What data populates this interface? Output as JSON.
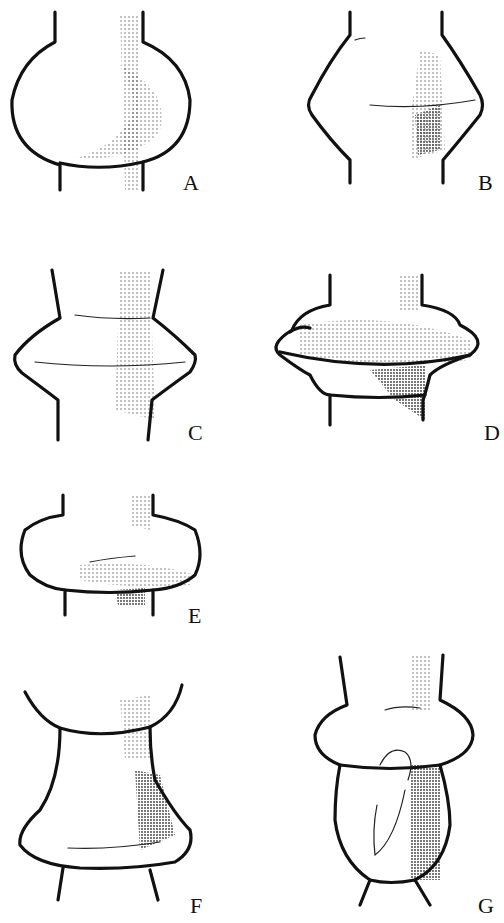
{
  "figure": {
    "panels": [
      {
        "id": "A",
        "label": "A",
        "shape": "spherical bulb between straight stems"
      },
      {
        "id": "B",
        "label": "B",
        "shape": "pointed double-cone swelling"
      },
      {
        "id": "C",
        "label": "C",
        "shape": "sharp-edged bicone swelling"
      },
      {
        "id": "D",
        "label": "D",
        "shape": "flattened disc with projecting rim"
      },
      {
        "id": "E",
        "label": "E",
        "shape": "squat rounded cushion"
      },
      {
        "id": "F",
        "label": "F",
        "shape": "concave-topped flared bell"
      },
      {
        "id": "G",
        "label": "G",
        "shape": "cushion collar above ovoid bulb"
      }
    ]
  }
}
